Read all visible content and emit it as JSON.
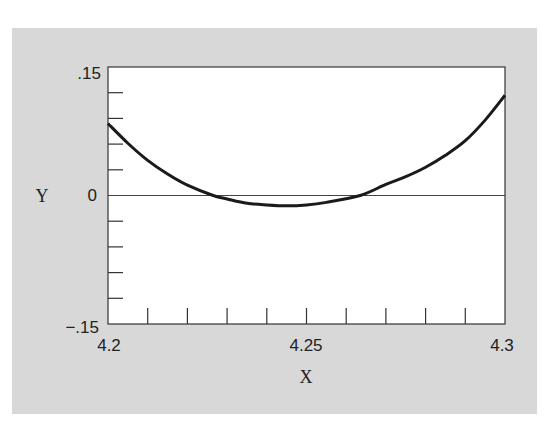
{
  "chart_data": {
    "type": "line",
    "title": "",
    "xlabel": "X",
    "ylabel": "Y",
    "xlim": [
      4.2,
      4.3
    ],
    "ylim": [
      -0.15,
      0.15
    ],
    "x_tick_labels": [
      "4.2",
      "4.25",
      "4.3"
    ],
    "y_tick_labels": [
      ".15",
      "0",
      "−.15"
    ],
    "x_minor_tick_step": 0.01,
    "y_minor_tick_step": 0.03,
    "grid": false,
    "zero_line": true,
    "legend": null,
    "series": [
      {
        "name": "curve",
        "color": "#1a1a1a",
        "x": [
          4.2,
          4.205,
          4.21,
          4.215,
          4.22,
          4.2265,
          4.23,
          4.235,
          4.24,
          4.245,
          4.25,
          4.255,
          4.2635,
          4.27,
          4.275,
          4.28,
          4.285,
          4.29,
          4.295,
          4.3
        ],
        "y": [
          0.084,
          0.061,
          0.041,
          0.025,
          0.012,
          0.0,
          -0.004,
          -0.009,
          -0.011,
          -0.012,
          -0.011,
          -0.008,
          0.0,
          0.013,
          0.022,
          0.033,
          0.047,
          0.064,
          0.088,
          0.117
        ]
      }
    ]
  }
}
